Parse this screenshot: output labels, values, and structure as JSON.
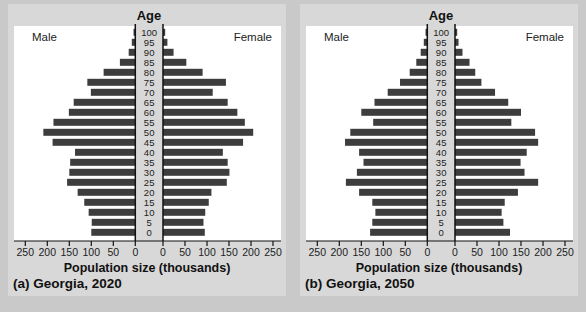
{
  "page": {
    "background": "#c9c9c9",
    "card_background": "#d8d8d8",
    "bar_color": "#3d3d3d",
    "axis_color": "#111111",
    "text_color": "#1c1c1c"
  },
  "axis": {
    "title": "Age",
    "xlabel": "Population size (thousands)",
    "tick_values": [
      250,
      200,
      150,
      100,
      50,
      0
    ],
    "tick_step": 50,
    "xlim": [
      0,
      250
    ]
  },
  "chart_data": [
    {
      "type": "bar",
      "subtype": "population-pyramid",
      "title": "Age",
      "caption": "(a) Georgia, 2020",
      "xlabel": "Population size (thousands)",
      "xlim": [
        0,
        250
      ],
      "x_units": "thousands",
      "ages": [
        0,
        5,
        10,
        15,
        20,
        25,
        30,
        35,
        40,
        45,
        50,
        55,
        60,
        65,
        70,
        75,
        80,
        85,
        90,
        95,
        100
      ],
      "series": [
        {
          "name": "Male",
          "values": [
            100,
            99,
            106,
            116,
            131,
            155,
            150,
            148,
            137,
            188,
            209,
            186,
            151,
            140,
            101,
            109,
            72,
            35,
            15,
            8,
            4
          ]
        },
        {
          "name": "Female",
          "values": [
            95,
            92,
            96,
            104,
            110,
            145,
            151,
            147,
            136,
            182,
            205,
            186,
            169,
            147,
            113,
            143,
            90,
            53,
            24,
            10,
            5
          ]
        }
      ]
    },
    {
      "type": "bar",
      "subtype": "population-pyramid",
      "title": "Age",
      "caption": "(b) Georgia, 2050",
      "xlabel": "Population size (thousands)",
      "xlim": [
        0,
        250
      ],
      "x_units": "thousands",
      "ages": [
        0,
        5,
        10,
        15,
        20,
        25,
        30,
        35,
        40,
        45,
        50,
        55,
        60,
        65,
        70,
        75,
        80,
        85,
        90,
        95,
        100
      ],
      "series": [
        {
          "name": "Male",
          "values": [
            130,
            125,
            118,
            125,
            155,
            185,
            160,
            145,
            155,
            187,
            175,
            123,
            150,
            120,
            90,
            62,
            40,
            25,
            15,
            8,
            4
          ]
        },
        {
          "name": "Female",
          "values": [
            125,
            110,
            106,
            113,
            143,
            189,
            158,
            149,
            163,
            189,
            182,
            128,
            150,
            121,
            91,
            60,
            46,
            33,
            17,
            8,
            5
          ]
        }
      ]
    }
  ]
}
